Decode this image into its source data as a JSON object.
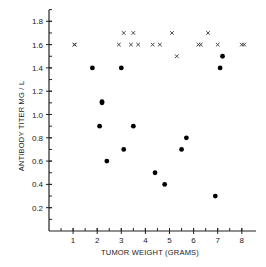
{
  "chart_data": {
    "type": "scatter",
    "title": "",
    "xlabel": "TUMOR WEIGHT (GRAMS)",
    "ylabel": "ANTIBODY TITER MG / L",
    "xlim": [
      0,
      8.6
    ],
    "ylim": [
      0,
      1.9
    ],
    "x_ticks": [
      1,
      2,
      3,
      4,
      5,
      6,
      7,
      8
    ],
    "x_tick_labels": [
      "1",
      "2",
      "3",
      "4",
      "5",
      "6",
      "7",
      "8"
    ],
    "x_minor_step": 0.5,
    "y_ticks": [
      0.2,
      0.4,
      0.6,
      0.8,
      1.0,
      1.2,
      1.4,
      1.6,
      1.8
    ],
    "y_tick_labels": [
      "0.2",
      "0.4",
      "0.6",
      "0.8",
      "1.0",
      "1.2",
      "1.4",
      "1.6",
      "1.8"
    ],
    "y_minor_step": 0.1,
    "grid": false,
    "legend": null,
    "series": [
      {
        "name": "filled-circles",
        "marker": "circle",
        "color": "#000000",
        "points": [
          [
            1.8,
            1.4
          ],
          [
            3.0,
            1.4
          ],
          [
            2.2,
            1.1
          ],
          [
            2.2,
            1.11
          ],
          [
            2.1,
            0.9
          ],
          [
            3.5,
            0.9
          ],
          [
            3.1,
            0.7
          ],
          [
            2.4,
            0.6
          ],
          [
            5.7,
            0.8
          ],
          [
            5.5,
            0.7
          ],
          [
            4.4,
            0.5
          ],
          [
            4.8,
            0.4
          ],
          [
            7.2,
            1.5
          ],
          [
            7.1,
            1.4
          ],
          [
            6.9,
            0.3
          ]
        ]
      },
      {
        "name": "crosses",
        "marker": "x",
        "color": "#333333",
        "points": [
          [
            1.05,
            1.6
          ],
          [
            1.07,
            1.6
          ],
          [
            2.9,
            1.6
          ],
          [
            3.4,
            1.6
          ],
          [
            3.7,
            1.6
          ],
          [
            4.3,
            1.6
          ],
          [
            4.6,
            1.6
          ],
          [
            6.2,
            1.6
          ],
          [
            6.3,
            1.6
          ],
          [
            7.0,
            1.6
          ],
          [
            8.0,
            1.6
          ],
          [
            8.1,
            1.6
          ],
          [
            3.1,
            1.7
          ],
          [
            3.5,
            1.7
          ],
          [
            5.1,
            1.7
          ],
          [
            6.6,
            1.7
          ],
          [
            5.3,
            1.5
          ]
        ]
      }
    ]
  }
}
